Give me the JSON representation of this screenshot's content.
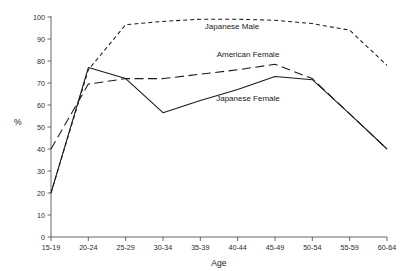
{
  "chart_data": {
    "type": "line",
    "title": "",
    "xlabel": "Age",
    "ylabel": "%",
    "categories": [
      "15-19",
      "20-24",
      "25-29",
      "30-34",
      "35-39",
      "40-44",
      "45-49",
      "50-54",
      "55-59",
      "60-64"
    ],
    "xtick_labels": [
      "15-19",
      "20-24",
      "25-29",
      "30-34",
      "35-39",
      "40-44",
      "45-49",
      "50-54",
      "55-59",
      "60-64"
    ],
    "ytick_labels": [
      "0",
      "10",
      "20",
      "30",
      "40",
      "50",
      "60",
      "70",
      "80",
      "90",
      "100"
    ],
    "ylim": [
      0,
      100
    ],
    "ytick_step": 10,
    "grid": false,
    "legend_position": "inline-annotations",
    "series": [
      {
        "name": "Japanese Male",
        "style": "short-dashed",
        "label_x_category": "35-39",
        "values": [
          20,
          76,
          96.5,
          98,
          99,
          99,
          98.5,
          97,
          94,
          78
        ]
      },
      {
        "name": "American Female",
        "style": "long-dashed",
        "label_x_category": "40-44",
        "values": [
          40,
          69.5,
          72,
          72,
          74,
          76,
          78.5,
          72,
          56,
          40
        ]
      },
      {
        "name": "Japanese Female",
        "style": "solid",
        "label_x_category": "40-44",
        "values": [
          20,
          77,
          72,
          56.5,
          62,
          67,
          73,
          71.5,
          56,
          40
        ]
      }
    ]
  },
  "annotations": {
    "japanese_male": "Japanese Male",
    "american_female": "American Female",
    "japanese_female": "Japanese Female"
  }
}
